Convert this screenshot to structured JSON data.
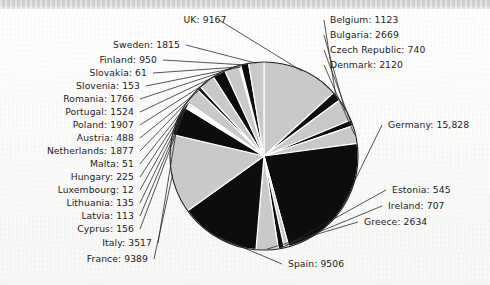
{
  "figure": {
    "kind": "scanned-pie-chart",
    "background_color": "#fbfbfa",
    "top_band_color": "#d6d6d6",
    "outline_color": "#1a1a1a",
    "leader_color": "#2a2a2a"
  },
  "chart_data": {
    "type": "pie",
    "title": "",
    "xlabel": "",
    "ylabel": "",
    "legend_position": "none",
    "grid": false,
    "label_format": "{name}: {value}",
    "start_angle_deg": 0,
    "direction": "clockwise",
    "slice_colors": [
      "#c9c9c9",
      "#0d0d0d"
    ],
    "categories": [
      "UK",
      "Belgium",
      "Bulgaria",
      "Czech Republic",
      "Denmark",
      "Germany",
      "Estonia",
      "Ireland",
      "Greece",
      "Spain",
      "France",
      "Italy",
      "Cyprus",
      "Latvia",
      "Lithuania",
      "Luxembourg",
      "Hungary",
      "Malta",
      "Netherlands",
      "Austria",
      "Poland",
      "Portugal",
      "Romania",
      "Slovenia",
      "Slovakia",
      "Finland",
      "Sweden"
    ],
    "values": [
      9167,
      1123,
      2669,
      740,
      2120,
      15828,
      545,
      707,
      2634,
      9506,
      9389,
      3517,
      156,
      113,
      135,
      12,
      225,
      51,
      1877,
      488,
      1907,
      1524,
      1766,
      153,
      61,
      950,
      1815
    ],
    "total": 64777
  },
  "labels": {
    "uk": "UK: 9167",
    "belgium": "Belgium: 1123",
    "bulgaria": "Bulgaria: 2669",
    "czech_republic": "Czech Republic: 740",
    "denmark": "Denmark: 2120",
    "germany": "Germany: 15,828",
    "estonia": "Estonia: 545",
    "ireland": "Ireland: 707",
    "greece": "Greece: 2634",
    "spain": "Spain: 9506",
    "france": "France: 9389",
    "italy": "Italy: 3517",
    "cyprus": "Cyprus: 156",
    "latvia": "Latvia: 113",
    "lithuania": "Lithuania: 135",
    "luxembourg": "Luxembourg: 12",
    "hungary": "Hungary: 225",
    "malta": "Malta: 51",
    "netherlands": "Netherlands: 1877",
    "austria": "Austria: 488",
    "poland": "Poland: 1907",
    "portugal": "Portugal: 1524",
    "romania": "Romania: 1766",
    "slovenia": "Slovenia: 153",
    "slovakia": "Slovakia: 61",
    "finland": "Finland: 950",
    "sweden": "Sweden: 1815"
  }
}
